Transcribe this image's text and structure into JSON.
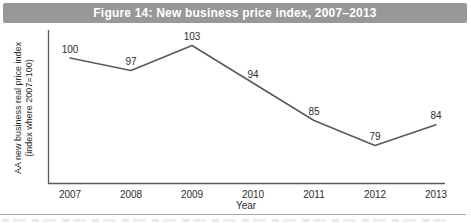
{
  "figure": {
    "title": "Figure 14: New business price index, 2007–2013",
    "colors": {
      "title_bar_bg": "#989898",
      "title_text": "#ffffff",
      "line": "#58595b",
      "axis": "#58595b",
      "text": "#2d2d2d"
    }
  },
  "chart_data": {
    "type": "line",
    "x": [
      "2007",
      "2008",
      "2009",
      "2010",
      "2011",
      "2012",
      "2013"
    ],
    "values": [
      100,
      97,
      103,
      94,
      85,
      79,
      84
    ],
    "data_labels": [
      "100",
      "97",
      "103",
      "94",
      "85",
      "79",
      "84"
    ],
    "title": "Figure 14: New business price index, 2007–2013",
    "xlabel": "Year",
    "ylabel": "AA new business real price index",
    "ylabel_line2": "(index where 2007=100)",
    "ylim": [
      70,
      106
    ],
    "grid": false,
    "legend": "none",
    "markers": "none",
    "y_ticks_visible": false
  }
}
